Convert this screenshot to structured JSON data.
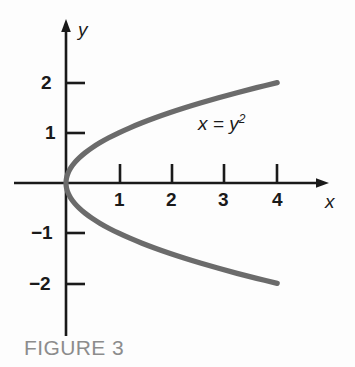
{
  "figure": {
    "caption": "FIGURE 3",
    "caption_color": "#8c8c8c",
    "background_color": "#fdfdfd",
    "axis_color": "#1a1a1a",
    "curve_color": "#6b6b6b"
  },
  "axes": {
    "x_name": "x",
    "y_name": "y",
    "x_tick_labels": [
      "1",
      "2",
      "3",
      "4"
    ],
    "y_tick_labels": [
      "2",
      "1",
      "−1",
      "−2"
    ]
  },
  "curve": {
    "equation_lhs": "x = y",
    "equation_exponent": "2",
    "equation_full": "x = y²"
  },
  "chart_data": {
    "type": "line",
    "title": "FIGURE 3",
    "xlabel": "x",
    "ylabel": "y",
    "grid": false,
    "legend": "none",
    "annotations": [
      {
        "text": "x = y²",
        "x": 2.65,
        "y": 1.25
      }
    ],
    "xlim": [
      -0.35,
      5.2
    ],
    "ylim": [
      -3.05,
      3.25
    ],
    "xticks": [
      1,
      2,
      3,
      4
    ],
    "yticks": [
      2,
      1,
      -1,
      -2
    ],
    "series": [
      {
        "name": "x = y^2",
        "relation": "x = y^2",
        "parametrized_by": "y",
        "y": [
          -2.0,
          -1.9,
          -1.8,
          -1.7,
          -1.6,
          -1.5,
          -1.4,
          -1.3,
          -1.2,
          -1.1,
          -1.0,
          -0.9,
          -0.8,
          -0.7,
          -0.6,
          -0.5,
          -0.4,
          -0.3,
          -0.2,
          -0.1,
          0.0,
          0.1,
          0.2,
          0.3,
          0.4,
          0.5,
          0.6,
          0.7,
          0.8,
          0.9,
          1.0,
          1.1,
          1.2,
          1.3,
          1.4,
          1.5,
          1.6,
          1.7,
          1.8,
          1.9,
          2.0
        ],
        "x": [
          4.0,
          3.61,
          3.24,
          2.89,
          2.56,
          2.25,
          1.96,
          1.69,
          1.44,
          1.21,
          1.0,
          0.81,
          0.64,
          0.49,
          0.36,
          0.25,
          0.16,
          0.09,
          0.04,
          0.01,
          0.0,
          0.01,
          0.04,
          0.09,
          0.16,
          0.25,
          0.36,
          0.49,
          0.64,
          0.81,
          1.0,
          1.21,
          1.44,
          1.69,
          1.96,
          2.25,
          2.56,
          2.89,
          3.24,
          3.61,
          4.0
        ]
      }
    ]
  }
}
